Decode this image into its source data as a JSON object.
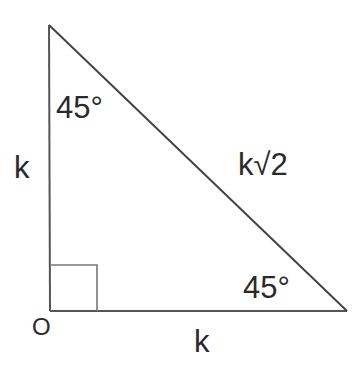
{
  "diagram": {
    "type": "right-triangle",
    "vertices": {
      "top": {
        "x": 49,
        "y": 25
      },
      "origin": {
        "x": 50,
        "y": 311,
        "label": "O"
      },
      "right": {
        "x": 347,
        "y": 311
      }
    },
    "right_angle_marker": {
      "x": 50,
      "y": 265,
      "size": 47
    },
    "labels": {
      "left_side": "k",
      "bottom_side": "k",
      "hypotenuse": "k√2",
      "top_angle": "45°",
      "right_angle": "45°",
      "origin": "O"
    },
    "colors": {
      "stroke": "#555555",
      "text": "#2a2a2a",
      "background": "#ffffff"
    }
  }
}
